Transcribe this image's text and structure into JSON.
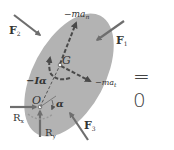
{
  "diagram": {
    "type": "free-body-diagram",
    "body": {
      "shape": "tilted ellipse",
      "fill": "#b3b3b3"
    },
    "points": {
      "pivot": {
        "label": "O"
      },
      "center_of_mass": {
        "label": "G"
      }
    },
    "forces": {
      "F1": {
        "label": "F",
        "sub": "1"
      },
      "F2": {
        "label": "F",
        "sub": "2"
      },
      "F3": {
        "label": "F",
        "sub": "3"
      },
      "Rx": {
        "label": "R",
        "sub": "x"
      },
      "Ry": {
        "label": "R",
        "sub": "y"
      }
    },
    "inertial_terms": {
      "normal": {
        "label": "−ma",
        "sub": "n"
      },
      "tangential": {
        "label": "−ma",
        "sub": "t"
      },
      "moment": {
        "label": "−Iα"
      }
    },
    "angle": {
      "label": "α"
    },
    "equation_rhs": "= 0",
    "colors": {
      "body_fill": "#b3b3b3",
      "force_arrow": "#6e6e6e",
      "inertial_arrow": "#4a4a4a",
      "text": "#333333"
    }
  }
}
